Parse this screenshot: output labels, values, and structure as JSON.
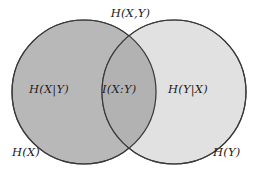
{
  "diagram": {
    "type": "venn-two-set",
    "title_label": "H(X,Y)",
    "background_color": "#ffffff",
    "stroke_color": "#3a3a3a",
    "regions": {
      "left_only": {
        "label": "H(X|Y)",
        "fill_color": "#b8b8b8",
        "meaning": "conditional-entropy-x-given-y"
      },
      "intersection": {
        "label": "I(X:Y)",
        "fill_color": "#b2b2b2",
        "meaning": "mutual-information"
      },
      "right_only": {
        "label": "H(Y|X)",
        "fill_color": "#d9d9d9",
        "meaning": "conditional-entropy-y-given-x"
      }
    },
    "set_labels": {
      "left": "H(X)",
      "right": "H(Y)"
    },
    "geometry": {
      "left_circle": {
        "cx": 84,
        "cy": 92,
        "r": 72
      },
      "right_circle": {
        "cx": 174,
        "cy": 92,
        "r": 72
      }
    }
  }
}
